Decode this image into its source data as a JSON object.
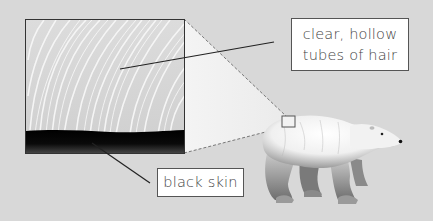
{
  "diagram": {
    "labels": {
      "hair": {
        "line1": "clear, hollow",
        "line2": "tubes of hair"
      },
      "skin": {
        "text": "black skin"
      }
    },
    "colors": {
      "background": "#d8d8d8",
      "inset_fur": "#e6e6e6",
      "skin": "#111111",
      "label_bg": "#ffffff",
      "leader_line": "#222222"
    }
  }
}
